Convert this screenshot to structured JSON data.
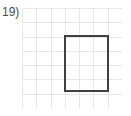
{
  "problem": {
    "label": "19)",
    "label_color": "#4a4a4a"
  },
  "grid": {
    "columns": 7,
    "rows": 7,
    "cell_size_px": 14,
    "origin_x_px": 22,
    "origin_y_px": 8,
    "width_px": 100,
    "height_px": 100,
    "line_color": "#e6e6e6",
    "line_width_px": 1,
    "background_color": "#ffffff"
  },
  "shape": {
    "type": "rectangle",
    "stroke_color": "#3f3f46",
    "stroke_width_px": 2,
    "fill": "none",
    "grid_units": {
      "x": 3,
      "y": 2,
      "width": 3,
      "height": 4
    },
    "px": {
      "x": 43,
      "y": 28,
      "width": 43,
      "height": 55
    }
  }
}
